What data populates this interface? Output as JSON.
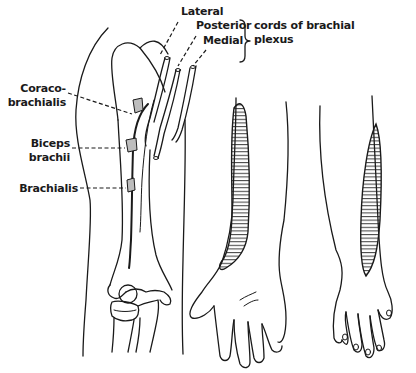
{
  "figure": {
    "panels": [
      "arm-dissection",
      "forearm-anterior-sensory",
      "forearm-posterior-sensory"
    ]
  },
  "labels": {
    "lateral": "Lateral",
    "posterior": "Posterior",
    "medial": "Medial",
    "cords_line1": "cords of brachial",
    "cords_line2": "plexus",
    "coraco_line1": "Coraco-",
    "coraco_line2": "brachialis",
    "biceps_line1": "Biceps",
    "biceps_line2": "brachii",
    "brachialis": "Brachialis"
  },
  "colors": {
    "ink": "#1a1a1a",
    "muscle_fill": "#bdbdbd",
    "background": "#ffffff"
  }
}
